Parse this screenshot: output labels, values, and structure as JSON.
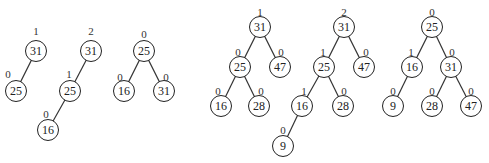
{
  "diagram": {
    "type": "avl-trees",
    "trees": [
      {
        "name": "tree-1",
        "nodes": [
          {
            "id": "a",
            "key": "31",
            "balance": "1",
            "x": 36,
            "y": 51,
            "bx": 36,
            "by": 31
          },
          {
            "id": "b",
            "key": "25",
            "balance": "0",
            "x": 16,
            "y": 91,
            "bx": 8,
            "by": 74
          }
        ],
        "edges": [
          [
            "a",
            "b"
          ]
        ]
      },
      {
        "name": "tree-2",
        "nodes": [
          {
            "id": "a",
            "key": "31",
            "balance": "2",
            "x": 91,
            "y": 51,
            "bx": 91,
            "by": 31
          },
          {
            "id": "b",
            "key": "25",
            "balance": "1",
            "x": 70,
            "y": 91,
            "bx": 69,
            "by": 74
          },
          {
            "id": "c",
            "key": "16",
            "balance": "0",
            "x": 48,
            "y": 130,
            "bx": 46,
            "by": 114
          }
        ],
        "edges": [
          [
            "a",
            "b"
          ],
          [
            "b",
            "c"
          ]
        ]
      },
      {
        "name": "tree-3",
        "nodes": [
          {
            "id": "a",
            "key": "25",
            "balance": "0",
            "x": 144,
            "y": 51,
            "bx": 144,
            "by": 34
          },
          {
            "id": "b",
            "key": "16",
            "balance": "0",
            "x": 124,
            "y": 91,
            "bx": 120,
            "by": 77
          },
          {
            "id": "c",
            "key": "31",
            "balance": "0",
            "x": 164,
            "y": 91,
            "bx": 166,
            "by": 77
          }
        ],
        "edges": [
          [
            "a",
            "b"
          ],
          [
            "a",
            "c"
          ]
        ]
      },
      {
        "name": "tree-4",
        "nodes": [
          {
            "id": "a",
            "key": "31",
            "balance": "1",
            "x": 260,
            "y": 27,
            "bx": 260,
            "by": 12
          },
          {
            "id": "b",
            "key": "25",
            "balance": "0",
            "x": 240,
            "y": 67,
            "bx": 238,
            "by": 52
          },
          {
            "id": "c",
            "key": "47",
            "balance": "0",
            "x": 280,
            "y": 67,
            "bx": 281,
            "by": 52
          },
          {
            "id": "d",
            "key": "16",
            "balance": "0",
            "x": 221,
            "y": 106,
            "bx": 218,
            "by": 91
          },
          {
            "id": "e",
            "key": "28",
            "balance": "0",
            "x": 259,
            "y": 106,
            "bx": 261,
            "by": 91
          }
        ],
        "edges": [
          [
            "a",
            "b"
          ],
          [
            "a",
            "c"
          ],
          [
            "b",
            "d"
          ],
          [
            "b",
            "e"
          ]
        ]
      },
      {
        "name": "tree-5",
        "nodes": [
          {
            "id": "a",
            "key": "31",
            "balance": "2",
            "x": 344,
            "y": 27,
            "bx": 344,
            "by": 12
          },
          {
            "id": "b",
            "key": "25",
            "balance": "1",
            "x": 324,
            "y": 67,
            "bx": 323,
            "by": 52
          },
          {
            "id": "c",
            "key": "47",
            "balance": "0",
            "x": 364,
            "y": 67,
            "bx": 366,
            "by": 52
          },
          {
            "id": "d",
            "key": "16",
            "balance": "1",
            "x": 302,
            "y": 106,
            "bx": 304,
            "by": 91
          },
          {
            "id": "e",
            "key": "28",
            "balance": "0",
            "x": 343,
            "y": 106,
            "bx": 344,
            "by": 91
          },
          {
            "id": "f",
            "key": "9",
            "balance": "0",
            "x": 283,
            "y": 146,
            "bx": 283,
            "by": 130
          }
        ],
        "edges": [
          [
            "a",
            "b"
          ],
          [
            "a",
            "c"
          ],
          [
            "b",
            "d"
          ],
          [
            "b",
            "e"
          ],
          [
            "d",
            "f"
          ]
        ]
      },
      {
        "name": "tree-6",
        "nodes": [
          {
            "id": "a",
            "key": "25",
            "balance": "0",
            "x": 432,
            "y": 27,
            "bx": 432,
            "by": 12
          },
          {
            "id": "b",
            "key": "16",
            "balance": "1",
            "x": 412,
            "y": 67,
            "bx": 411,
            "by": 52
          },
          {
            "id": "c",
            "key": "31",
            "balance": "0",
            "x": 451,
            "y": 67,
            "bx": 452,
            "by": 52
          },
          {
            "id": "d",
            "key": "9",
            "balance": "0",
            "x": 393,
            "y": 106,
            "bx": 393,
            "by": 91
          },
          {
            "id": "e",
            "key": "28",
            "balance": "0",
            "x": 432,
            "y": 106,
            "bx": 432,
            "by": 91
          },
          {
            "id": "f",
            "key": "47",
            "balance": "0",
            "x": 471,
            "y": 106,
            "bx": 471,
            "by": 91
          }
        ],
        "edges": [
          [
            "a",
            "b"
          ],
          [
            "a",
            "c"
          ],
          [
            "b",
            "d"
          ],
          [
            "c",
            "e"
          ],
          [
            "c",
            "f"
          ]
        ]
      }
    ]
  }
}
